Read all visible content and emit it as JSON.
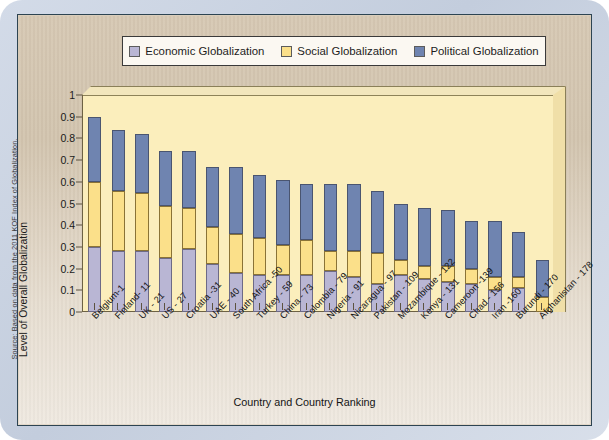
{
  "source_note": "Source: Based on data from the 2011 KOF Index of Globalization.",
  "legend": {
    "items": [
      {
        "label": "Economic Globalization",
        "color": "#b9b6d4",
        "icon": "legend-swatch-icon"
      },
      {
        "label": "Social Globalization",
        "color": "#fbe08a",
        "icon": "legend-swatch-icon"
      },
      {
        "label": "Political Globalization",
        "color": "#6f84b0",
        "icon": "legend-swatch-icon"
      }
    ]
  },
  "chart_data": {
    "type": "bar",
    "stacked": true,
    "title": "",
    "xlabel": "Country and Country Ranking",
    "ylabel": "Level of Overall Globalization",
    "ylim": [
      0,
      1
    ],
    "yticks": [
      "0",
      "0.1",
      "0.2",
      "0.3",
      "0.4",
      "0.5",
      "0.6",
      "0.7",
      "0.8",
      "0.9",
      "1"
    ],
    "grid": false,
    "legend_position": "top",
    "categories": [
      "Belgium-1",
      "Finland- 11",
      "UK - 21",
      "US - 27",
      "Croatia -31",
      "UAE - 40",
      "South Africa -50",
      "Turkey - 59",
      "China - 73",
      "Colombia - 79",
      "Nigeria - 91",
      "Nicaragua - 97",
      "Pakistan - 109",
      "Mozambique - 122",
      "Kenya - 131",
      "Cameroon -139",
      "Chad - 156",
      "Iran -160",
      "Burundi - 170",
      "Afghanistan - 178"
    ],
    "series": [
      {
        "name": "Economic Globalization",
        "color": "#b9b6d4",
        "values": [
          0.3,
          0.28,
          0.28,
          0.25,
          0.29,
          0.22,
          0.18,
          0.17,
          0.17,
          0.17,
          0.19,
          0.16,
          0.13,
          0.17,
          0.15,
          0.14,
          0.13,
          0.1,
          0.11,
          0.0
        ]
      },
      {
        "name": "Social Globalization",
        "color": "#fbe08a",
        "values": [
          0.3,
          0.28,
          0.27,
          0.24,
          0.19,
          0.17,
          0.18,
          0.17,
          0.14,
          0.16,
          0.09,
          0.12,
          0.14,
          0.07,
          0.06,
          0.07,
          0.07,
          0.06,
          0.05,
          0.07
        ]
      },
      {
        "name": "Political Globalization",
        "color": "#6f84b0",
        "values": [
          0.3,
          0.28,
          0.27,
          0.25,
          0.26,
          0.28,
          0.31,
          0.29,
          0.3,
          0.26,
          0.31,
          0.31,
          0.29,
          0.26,
          0.27,
          0.26,
          0.22,
          0.26,
          0.21,
          0.17
        ]
      }
    ],
    "totals": [
      0.9,
      0.84,
      0.82,
      0.74,
      0.74,
      0.67,
      0.67,
      0.63,
      0.61,
      0.59,
      0.59,
      0.59,
      0.56,
      0.5,
      0.48,
      0.47,
      0.42,
      0.42,
      0.37,
      0.24
    ]
  }
}
